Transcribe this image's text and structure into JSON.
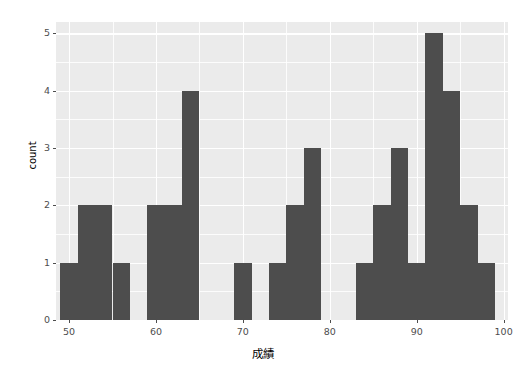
{
  "chart_data": {
    "type": "bar",
    "chart_kind": "histogram",
    "title": "",
    "xlabel": "成績",
    "ylabel": "count",
    "xlim": [
      48.5,
      100.5
    ],
    "ylim": [
      0,
      5.2
    ],
    "grid": true,
    "legend": "none",
    "bar_color": "#4d4d4d",
    "panel_color": "#ebebeb",
    "gridline_color": "#ffffff",
    "binwidth": 2,
    "xticks": [
      50,
      60,
      70,
      80,
      90,
      100
    ],
    "xtick_labels": [
      "50",
      "60",
      "70",
      "80",
      "90",
      "100"
    ],
    "yticks": [
      0,
      1,
      2,
      3,
      4,
      5
    ],
    "ytick_labels": [
      "0",
      "1",
      "2",
      "3",
      "4",
      "5"
    ],
    "x_minor_ticks": [
      55,
      65,
      75,
      85,
      95
    ],
    "y_minor_ticks": [
      0.5,
      1.5,
      2.5,
      3.5,
      4.5
    ],
    "bin_edges": [
      49,
      51,
      53,
      55,
      57,
      59,
      61,
      63,
      65,
      67,
      69,
      71,
      73,
      75,
      77,
      79,
      81,
      83,
      85,
      87,
      89,
      91,
      93,
      95,
      97,
      99
    ],
    "bin_centers": [
      50,
      52,
      54,
      56,
      58,
      60,
      62,
      64,
      66,
      68,
      70,
      72,
      74,
      76,
      78,
      80,
      82,
      84,
      86,
      88,
      90,
      92,
      94,
      96,
      98
    ],
    "values": [
      1,
      2,
      2,
      1,
      0,
      2,
      2,
      4,
      0,
      0,
      1,
      0,
      1,
      2,
      3,
      0,
      0,
      1,
      2,
      3,
      1,
      5,
      4,
      2,
      2,
      1
    ],
    "bars": [
      {
        "x0": 49,
        "x1": 51,
        "count": 1
      },
      {
        "x0": 51,
        "x1": 53,
        "count": 2
      },
      {
        "x0": 53,
        "x1": 55,
        "count": 2
      },
      {
        "x0": 55,
        "x1": 57,
        "count": 1
      },
      {
        "x0": 57,
        "x1": 59,
        "count": 0
      },
      {
        "x0": 59,
        "x1": 61,
        "count": 2
      },
      {
        "x0": 61,
        "x1": 63,
        "count": 2
      },
      {
        "x0": 63,
        "x1": 65,
        "count": 4
      },
      {
        "x0": 65,
        "x1": 67,
        "count": 0
      },
      {
        "x0": 67,
        "x1": 69,
        "count": 0
      },
      {
        "x0": 69,
        "x1": 71,
        "count": 1
      },
      {
        "x0": 71,
        "x1": 73,
        "count": 0
      },
      {
        "x0": 73,
        "x1": 75,
        "count": 1
      },
      {
        "x0": 75,
        "x1": 77,
        "count": 2
      },
      {
        "x0": 77,
        "x1": 79,
        "count": 3
      },
      {
        "x0": 79,
        "x1": 81,
        "count": 0
      },
      {
        "x0": 81,
        "x1": 83,
        "count": 0
      },
      {
        "x0": 83,
        "x1": 85,
        "count": 1
      },
      {
        "x0": 85,
        "x1": 87,
        "count": 2
      },
      {
        "x0": 87,
        "x1": 89,
        "count": 3
      },
      {
        "x0": 89,
        "x1": 91,
        "count": 1
      },
      {
        "x0": 91,
        "x1": 93,
        "count": 5
      },
      {
        "x0": 93,
        "x1": 95,
        "count": 4
      },
      {
        "x0": 95,
        "x1": 97,
        "count": 2
      },
      {
        "x0": 97,
        "x1": 99,
        "count": 1
      }
    ]
  }
}
